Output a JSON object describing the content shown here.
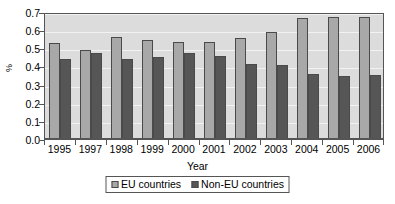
{
  "chart_data": {
    "type": "bar",
    "title": "",
    "subtitle": "",
    "xlabel": "Year",
    "ylabel": "%",
    "ylim": [
      0.0,
      0.7
    ],
    "ytick_labels": [
      "0.0",
      "0.1",
      "0.2",
      "0.3",
      "0.4",
      "0.5",
      "0.6",
      "0.7"
    ],
    "ytick_values": [
      0.0,
      0.1,
      0.2,
      0.3,
      0.4,
      0.5,
      0.6,
      0.7
    ],
    "grid": true,
    "grid_axis": "y",
    "legend_position": "bottom-center",
    "categories": [
      "1995",
      "1997",
      "1998",
      "1999",
      "2000",
      "2001",
      "2002",
      "2003",
      "2004",
      "2005",
      "2006"
    ],
    "series": [
      {
        "name": "EU countries",
        "color": "#a8a8a8",
        "values": [
          0.53,
          0.49,
          0.565,
          0.545,
          0.535,
          0.535,
          0.555,
          0.59,
          0.665,
          0.675,
          0.675
        ]
      },
      {
        "name": "Non-EU countries",
        "color": "#565656",
        "values": [
          0.44,
          0.475,
          0.44,
          0.45,
          0.475,
          0.455,
          0.415,
          0.41,
          0.36,
          0.35,
          0.355
        ]
      }
    ],
    "plot_background": "#dcdcdc",
    "gridline_color": "#f2f2f2",
    "axis_color": "#555555"
  },
  "legend": {
    "items": [
      {
        "label": "EU countries"
      },
      {
        "label": "Non-EU countries"
      }
    ]
  },
  "axes": {
    "y_title": "%",
    "x_title": "Year"
  }
}
